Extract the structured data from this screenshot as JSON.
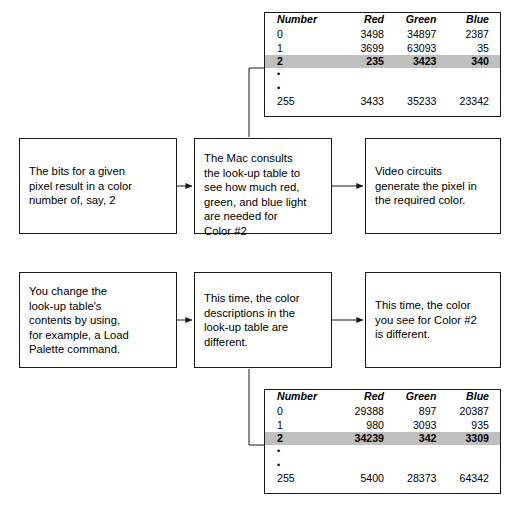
{
  "diagram": {
    "boxes": {
      "bits": "The bits for a given\npixel result in a color\nnumber of, say, 2",
      "consults": "The Mac consults\nthe look-up table to\nsee how much red,\ngreen, and blue light\nare needed for\nColor #2",
      "video": "Video circuits\ngenerate the pixel in\nthe required color.",
      "change": "You change the\nlook-up table's\ncontents by using,\nfor example, a Load\nPalette command.",
      "this_time": "This time, the color\ndescriptions in the\nlook-up table are\ndifferent.",
      "different": "This time, the color\nyou see for Color #2\nis different."
    },
    "colors": {
      "line": "#1a1a1a",
      "highlight_row": "#bfbfbf",
      "background": "#ffffff",
      "text": "#000000"
    },
    "tables": {
      "top": {
        "columns": [
          "Number",
          "Red",
          "Green",
          "Blue"
        ],
        "rows": [
          {
            "number": "0",
            "red": "3498",
            "green": "34897",
            "blue": "2387",
            "highlight": false
          },
          {
            "number": "1",
            "red": "3699",
            "green": "63093",
            "blue": "35",
            "highlight": false
          },
          {
            "number": "2",
            "red": "235",
            "green": "3423",
            "blue": "340",
            "highlight": true
          },
          {
            "number": "•",
            "red": "",
            "green": "",
            "blue": "",
            "dots": true
          },
          {
            "number": "•",
            "red": "",
            "green": "",
            "blue": "",
            "dots": true
          },
          {
            "number": "255",
            "red": "3433",
            "green": "35233",
            "blue": "23342",
            "highlight": false
          }
        ]
      },
      "bottom": {
        "columns": [
          "Number",
          "Red",
          "Green",
          "Blue"
        ],
        "rows": [
          {
            "number": "0",
            "red": "29388",
            "green": "897",
            "blue": "20387",
            "highlight": false
          },
          {
            "number": "1",
            "red": "980",
            "green": "3093",
            "blue": "935",
            "highlight": false
          },
          {
            "number": "2",
            "red": "34239",
            "green": "342",
            "blue": "3309",
            "highlight": true
          },
          {
            "number": "•",
            "red": "",
            "green": "",
            "blue": "",
            "dots": true
          },
          {
            "number": "•",
            "red": "",
            "green": "",
            "blue": "",
            "dots": true
          },
          {
            "number": "255",
            "red": "5400",
            "green": "28373",
            "blue": "64342",
            "highlight": false
          }
        ]
      }
    }
  }
}
